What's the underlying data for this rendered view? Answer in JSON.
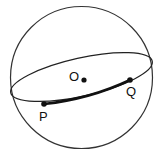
{
  "diagram": {
    "type": "sphere-great-circle",
    "colors": {
      "stroke": "#333333",
      "bold_arc": "#111111",
      "points": "#111111",
      "background": "#ffffff"
    },
    "sphere": {
      "cx": 81.5,
      "cy": 77.5,
      "r": 71
    },
    "great_circle": {
      "cx": 81.5,
      "cy": 77,
      "rx": 73,
      "ry": 19,
      "rotation_deg": -12.6
    },
    "points": [
      {
        "id": "O",
        "label": "O",
        "x": 84,
        "y": 80,
        "label_x": 69,
        "label_y": 81
      },
      {
        "id": "P",
        "label": "P",
        "x": 44,
        "y": 104,
        "label_x": 39,
        "label_y": 121
      },
      {
        "id": "Q",
        "label": "Q",
        "x": 130,
        "y": 80,
        "label_x": 126,
        "label_y": 96
      }
    ],
    "arc": {
      "from": "P",
      "to": "Q",
      "style": "bold"
    }
  }
}
